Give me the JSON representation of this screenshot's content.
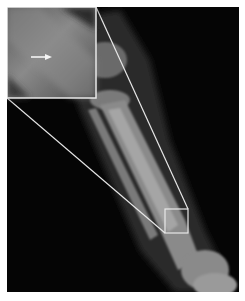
{
  "figure": {
    "type": "radiograph",
    "inset": {
      "label": "magnified view",
      "annotation": "arrow"
    },
    "highlight_box": {
      "label": "region of interest"
    },
    "colors": {
      "background": "#050505",
      "border": "#e8e8e8",
      "bone": "#9a9a9a"
    }
  }
}
